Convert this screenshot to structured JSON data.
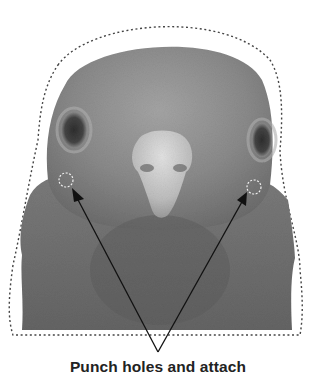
{
  "caption": "Punch holes and attach",
  "figure": {
    "cut_line": "dotted outline",
    "punch_holes": [
      {
        "side": "left",
        "cx": 66,
        "cy": 180,
        "r": 7
      },
      {
        "side": "right",
        "cx": 254,
        "cy": 187,
        "r": 7
      }
    ],
    "arrows_converge_at": {
      "x": 158,
      "y": 352
    }
  },
  "colors": {
    "background": "#ffffff",
    "feather_light": "#9a9a9a",
    "feather_dark": "#5e5e5e",
    "beak": "#c9c9c9",
    "outline": "#444444",
    "caption": "#222222"
  }
}
